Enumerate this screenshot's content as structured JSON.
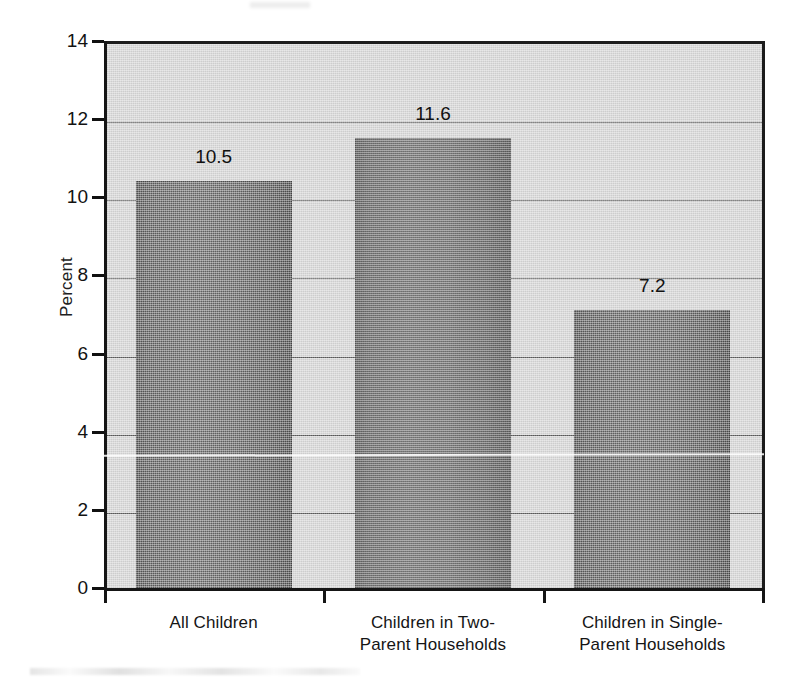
{
  "chart_data": {
    "type": "bar",
    "title": "",
    "subtitle": "",
    "xlabel": "",
    "ylabel": "Percent",
    "categories": [
      "All Children",
      "Children in Two-Parent Households",
      "Children in Single-Parent Households"
    ],
    "category_lines": [
      [
        "All Children"
      ],
      [
        "Children in Two-",
        "Parent Households"
      ],
      [
        "Children in Single-",
        "Parent Households"
      ]
    ],
    "values": [
      10.5,
      11.6,
      7.2
    ],
    "data_labels": [
      "10.5",
      "11.6",
      "7.2"
    ],
    "ylim": [
      0,
      14
    ],
    "y_ticks": [
      0,
      2,
      4,
      6,
      8,
      10,
      12,
      14
    ],
    "y_tick_labels": [
      "0",
      "2",
      "4",
      "6",
      "8",
      "10",
      "12",
      "14"
    ],
    "grid": true,
    "grid_axis": "y",
    "legend": false,
    "legend_position": "none",
    "bar_color": "#6f6f6f",
    "plot_background": "#d9d9d9",
    "axis_color": "#151515",
    "gridline_color": "#5e5e5e",
    "page_background": "#ffffff"
  },
  "axes": {
    "y_title": "Percent"
  }
}
